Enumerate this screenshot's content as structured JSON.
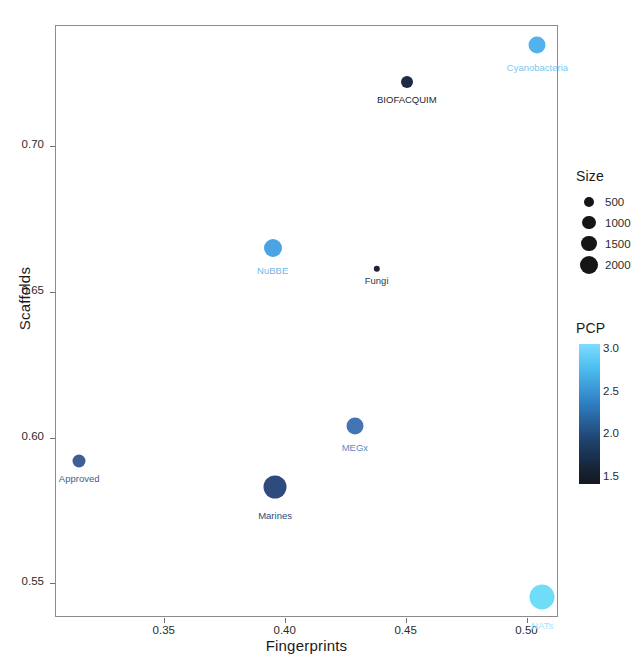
{
  "chart_data": {
    "type": "scatter",
    "title": "",
    "xlabel": "Fingerprints",
    "ylabel": "Scaffolds",
    "xlim": [
      0.305,
      0.513
    ],
    "ylim": [
      0.5385,
      0.7415
    ],
    "xticks": [
      0.35,
      0.4,
      0.45,
      0.5
    ],
    "xticklabels": [
      "0.35",
      "0.40",
      "0.45",
      "0.50"
    ],
    "yticks": [
      0.55,
      0.6,
      0.65,
      0.7
    ],
    "yticklabels": [
      "0.55",
      "0.60",
      "0.65",
      "0.70"
    ],
    "grid": false,
    "points": [
      {
        "label": "Approved",
        "x": 0.315,
        "y": 0.592,
        "size": 450,
        "pcp": 1.95,
        "color": "#3f5e96",
        "label_color": "#3f5e96",
        "radius": 6.5,
        "label_dx": 0,
        "label_dy": 10
      },
      {
        "label": "Marines",
        "x": 0.396,
        "y": 0.583,
        "size": 2000,
        "pcp": 1.7,
        "color": "#2f4a7c",
        "label_color": "#2f4a7c",
        "radius": 11.5,
        "label_dx": 0,
        "label_dy": 15
      },
      {
        "label": "NuBBE",
        "x": 0.395,
        "y": 0.665,
        "size": 1150,
        "pcp": 2.55,
        "color": "#4ba3e3",
        "label_color": "#6fb8ea",
        "radius": 9.0,
        "label_dx": 0,
        "label_dy": 12
      },
      {
        "label": "MEGx",
        "x": 0.429,
        "y": 0.604,
        "size": 1050,
        "pcp": 2.05,
        "color": "#4574b4",
        "label_color": "#5d8cc4",
        "radius": 8.5,
        "label_dx": 0,
        "label_dy": 12
      },
      {
        "label": "Fungi",
        "x": 0.438,
        "y": 0.658,
        "size": 180,
        "pcp": 1.45,
        "color": "#1d2430",
        "label_color": "#34383f",
        "radius": 3.2,
        "label_dx": 0,
        "label_dy": 7
      },
      {
        "label": "BIOFACQUIM",
        "x": 0.4505,
        "y": 0.722,
        "size": 520,
        "pcp": 1.55,
        "color": "#1f2b44",
        "label_color": "#24282f",
        "radius": 6.0,
        "label_dx": 0,
        "label_dy": 10
      },
      {
        "label": "Cyanobacteria",
        "x": 0.5045,
        "y": 0.7345,
        "size": 1050,
        "pcp": 2.8,
        "color": "#52b3ec",
        "label_color": "#7ec7ef",
        "radius": 8.5,
        "label_dx": 0,
        "label_dy": 12
      },
      {
        "label": "NATs",
        "x": 0.5065,
        "y": 0.5455,
        "size": 2000,
        "pcp": 3.0,
        "color": "#6fdcf8",
        "label_color": "#9fe6f8",
        "radius": 12.5,
        "label_dx": 0,
        "label_dy": 15
      }
    ],
    "legends": {
      "size": {
        "title": "Size",
        "entries": [
          {
            "label": "500",
            "value": 500,
            "radius": 5.0
          },
          {
            "label": "1000",
            "value": 1000,
            "radius": 6.6
          },
          {
            "label": "1500",
            "value": 1500,
            "radius": 7.8
          },
          {
            "label": "2000",
            "value": 2000,
            "radius": 9.0
          }
        ],
        "swatch_color": "#161616"
      },
      "pcp": {
        "title": "PCP",
        "ticks": [
          "3.0",
          "2.5",
          "2.0",
          "1.5"
        ],
        "tick_values": [
          3.0,
          2.5,
          2.0,
          1.5
        ],
        "min": 1.5,
        "max": 3.0,
        "high_color": "#7fdbff",
        "low_color": "#14181f"
      }
    }
  }
}
